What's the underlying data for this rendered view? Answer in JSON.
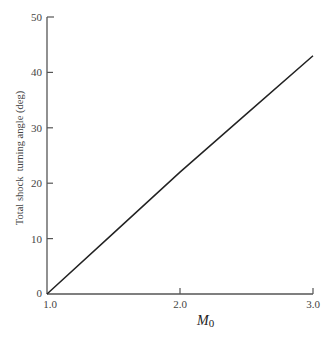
{
  "chart_data": {
    "type": "line",
    "title": "",
    "xlabel": "M0",
    "xlabel_main": "M",
    "xlabel_sub": "0",
    "ylabel": "Total shock  turning angle (deg)",
    "xlim": [
      1.0,
      3.0
    ],
    "ylim": [
      0,
      50
    ],
    "x_ticks": [
      1.0,
      2.0,
      3.0
    ],
    "x_tick_labels": [
      "1.0",
      "2.0",
      "3.0"
    ],
    "y_ticks": [
      0,
      10,
      20,
      30,
      40,
      50
    ],
    "y_tick_labels": [
      "0",
      "10",
      "20",
      "30",
      "40",
      "50"
    ],
    "grid": false,
    "legend": null,
    "series": [
      {
        "name": "Total shock turning angle",
        "x": [
          1.0,
          1.5,
          2.0,
          2.5,
          3.0
        ],
        "y": [
          0,
          11,
          22,
          32.5,
          43
        ],
        "color": "#222222"
      }
    ]
  }
}
